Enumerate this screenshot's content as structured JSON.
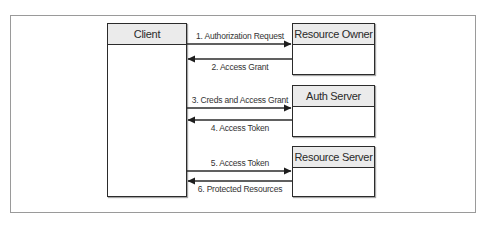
{
  "diagram": {
    "title": "",
    "actors": [
      {
        "id": "client",
        "label": "Client"
      },
      {
        "id": "resource_owner",
        "label": "Resource Owner"
      },
      {
        "id": "auth_server",
        "label": "Auth Server"
      },
      {
        "id": "resource_server",
        "label": "Resource Server"
      }
    ],
    "messages": [
      {
        "step": 1,
        "label": "1. Authorization Request",
        "from": "Client",
        "to": "Resource Owner",
        "direction": "right"
      },
      {
        "step": 2,
        "label": "2. Access Grant",
        "from": "Resource Owner",
        "to": "Client",
        "direction": "left"
      },
      {
        "step": 3,
        "label": "3. Creds and Access Grant",
        "from": "Client",
        "to": "Auth Server",
        "direction": "right"
      },
      {
        "step": 4,
        "label": "4. Access Token",
        "from": "Auth Server",
        "to": "Client",
        "direction": "left"
      },
      {
        "step": 5,
        "label": "5. Access Token",
        "from": "Client",
        "to": "Resource Server",
        "direction": "right"
      },
      {
        "step": 6,
        "label": "6. Protected Resources",
        "from": "Resource Server",
        "to": "Client",
        "direction": "left"
      }
    ],
    "colors": {
      "border": "#2b2b2b",
      "header_fill": "#ebebeb",
      "frame": "#9a9a9a",
      "background": "#ffffff"
    }
  }
}
